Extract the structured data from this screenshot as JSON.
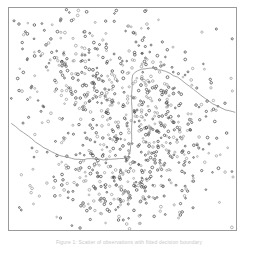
{
  "figure": {
    "caption": "Figure 1:  Scatter of observations with fitted decision boundary",
    "frame_color": "#9a9a9a",
    "background_color": "#ffffff"
  },
  "chart_data": {
    "type": "scatter",
    "title": "",
    "subtitle": "",
    "xlabel": "",
    "ylabel": "",
    "xlim": [
      0,
      229
    ],
    "ylim": [
      0,
      224
    ],
    "grid": false,
    "legend": null,
    "axis_ticks": {
      "x": [],
      "y": []
    },
    "point_style": {
      "marker": "circle",
      "radius": 1.05,
      "fill": "none",
      "stroke_dark": "#4a4a4a",
      "stroke_light": "#9e9e9e",
      "stroke_width": 0.75
    },
    "annotations": [
      {
        "name": "decision-boundary",
        "kind": "polyline",
        "color": "#8d8d8d",
        "width": 0.8,
        "points": [
          [
            3,
            117
          ],
          [
            7,
            120
          ],
          [
            11,
            123
          ],
          [
            15,
            126
          ],
          [
            19,
            129
          ],
          [
            23,
            132
          ],
          [
            27,
            135
          ],
          [
            31,
            138
          ],
          [
            35,
            141
          ],
          [
            39,
            143
          ],
          [
            43,
            145
          ],
          [
            47,
            147
          ],
          [
            51,
            149
          ],
          [
            55,
            150
          ],
          [
            59,
            151
          ],
          [
            63,
            152
          ],
          [
            67,
            153
          ],
          [
            71,
            153
          ],
          [
            75,
            153
          ],
          [
            79,
            152
          ],
          [
            83,
            152
          ],
          [
            87,
            152
          ],
          [
            91,
            152
          ],
          [
            95,
            153
          ],
          [
            99,
            153
          ],
          [
            103,
            153
          ],
          [
            107,
            152
          ],
          [
            111,
            152
          ],
          [
            115,
            152
          ],
          [
            118,
            151
          ],
          [
            120,
            149
          ],
          [
            122,
            145
          ],
          [
            123,
            140
          ],
          [
            124,
            133
          ],
          [
            124,
            126
          ],
          [
            124,
            118
          ],
          [
            124,
            110
          ],
          [
            124,
            102
          ],
          [
            124,
            94
          ],
          [
            124,
            86
          ],
          [
            124,
            78
          ],
          [
            124,
            72
          ],
          [
            125,
            68
          ],
          [
            127,
            65
          ],
          [
            130,
            63
          ],
          [
            134,
            62
          ],
          [
            138,
            61
          ],
          [
            142,
            61
          ],
          [
            146,
            61
          ],
          [
            150,
            62
          ],
          [
            154,
            63
          ],
          [
            158,
            64
          ],
          [
            162,
            66
          ],
          [
            166,
            68
          ],
          [
            170,
            70
          ],
          [
            174,
            73
          ],
          [
            178,
            76
          ],
          [
            182,
            79
          ],
          [
            186,
            82
          ],
          [
            190,
            85
          ],
          [
            194,
            88
          ],
          [
            198,
            91
          ],
          [
            202,
            94
          ],
          [
            206,
            97
          ],
          [
            210,
            99
          ],
          [
            214,
            101
          ],
          [
            218,
            103
          ],
          [
            222,
            104
          ],
          [
            226,
            105
          ],
          [
            228,
            105
          ]
        ]
      }
    ],
    "series": [
      {
        "name": "class-a-upper-left",
        "color": "#6a6a6a",
        "n_points": 300,
        "cluster": {
          "cx": 78,
          "cy": 72,
          "sx": 38,
          "sy": 40
        },
        "seed": 17
      },
      {
        "name": "class-b-right",
        "color": "#4a4a4a",
        "n_points": 260,
        "cluster": {
          "cx": 152,
          "cy": 110,
          "sx": 30,
          "sy": 38
        },
        "seed": 41
      },
      {
        "name": "class-c-lower",
        "color": "#555555",
        "n_points": 270,
        "cluster": {
          "cx": 108,
          "cy": 176,
          "sx": 40,
          "sy": 25
        },
        "seed": 73
      },
      {
        "name": "background-sparse",
        "color": "#a0a0a0",
        "n_points": 110,
        "cluster": {
          "cx": 115,
          "cy": 112,
          "sx": 68,
          "sy": 68
        },
        "seed": 97
      }
    ]
  }
}
